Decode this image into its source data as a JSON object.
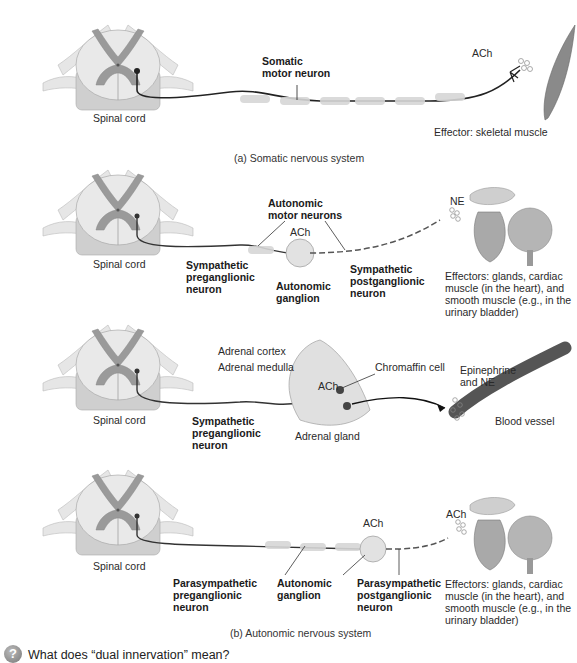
{
  "panels": {
    "somatic": {
      "spinal_cord": "Spinal cord",
      "neuron_label_1": "Somatic",
      "neuron_label_2": "motor neuron",
      "neurotransmitter": "ACh",
      "effector": "Effector: skeletal muscle",
      "caption": "(a) Somatic nervous system"
    },
    "sympathetic": {
      "spinal_cord": "Spinal cord",
      "motor_neurons_1": "Autonomic",
      "motor_neurons_2": "motor neurons",
      "ganglion_nt": "ACh",
      "pre_1": "Sympathetic",
      "pre_2": "preganglionic",
      "pre_3": "neuron",
      "ganglion_1": "Autonomic",
      "ganglion_2": "ganglion",
      "post_1": "Sympathetic",
      "post_2": "postganglionic",
      "post_3": "neuron",
      "effector_nt": "NE",
      "effectors_1": "Effectors: glands, cardiac",
      "effectors_2": "muscle (in the heart), and",
      "effectors_3": "smooth muscle (e.g., in the",
      "effectors_4": "urinary bladder)"
    },
    "adrenal": {
      "spinal_cord": "Spinal cord",
      "cortex": "Adrenal cortex",
      "medulla": "Adrenal medulla",
      "nt": "ACh",
      "chromaffin": "Chromaffin cell",
      "pre_1": "Sympathetic",
      "pre_2": "preganglionic",
      "pre_3": "neuron",
      "gland": "Adrenal gland",
      "hormones_1": "Epinephrine",
      "hormones_2": "and NE",
      "vessel": "Blood vessel"
    },
    "parasympathetic": {
      "spinal_cord": "Spinal cord",
      "ganglion_nt": "ACh",
      "effector_nt": "ACh",
      "pre_1": "Parasympathetic",
      "pre_2": "preganglionic",
      "pre_3": "neuron",
      "ganglion_1": "Autonomic",
      "ganglion_2": "ganglion",
      "post_1": "Parasympathetic",
      "post_2": "postganglionic",
      "post_3": "neuron",
      "effectors_1": "Effectors: glands, cardiac",
      "effectors_2": "muscle (in the heart), and",
      "effectors_3": "smooth muscle (e.g., in the",
      "effectors_4": "urinary bladder)",
      "caption": "(b) Autonomic nervous system"
    }
  },
  "question": {
    "icon": "?",
    "text": "What does “dual innervation” mean?"
  }
}
